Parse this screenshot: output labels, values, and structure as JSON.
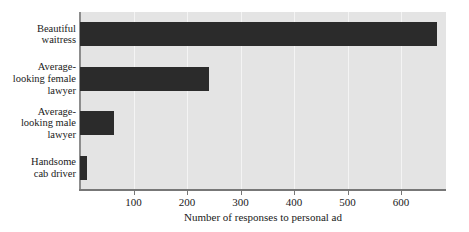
{
  "chart_data": {
    "type": "bar",
    "orientation": "horizontal",
    "title": "",
    "xlabel": "Number of responses to personal ad",
    "ylabel": "",
    "categories": [
      "Beautiful waitress",
      "Average-looking female lawyer",
      "Average-looking male lawyer",
      "Handsome cab driver"
    ],
    "category_lines": [
      [
        "Beautiful",
        "waitress"
      ],
      [
        "Average-",
        "looking female",
        "lawyer"
      ],
      [
        "Average-",
        "looking male",
        "lawyer"
      ],
      [
        "Handsome",
        "cab driver"
      ]
    ],
    "values": [
      668,
      241,
      64,
      13
    ],
    "xlim": [
      0,
      684
    ],
    "xticks": [
      100,
      200,
      300,
      400,
      500,
      600
    ],
    "xtick_labels": [
      "100",
      "200",
      "300",
      "400",
      "500",
      "600"
    ],
    "grid": "vertical",
    "legend": null,
    "colors": {
      "bar": "#2b2b2b",
      "plot_background": "#e4e4e4",
      "page_background": "#ffffff",
      "gridline": "#f4f4f4",
      "axis": "#777777",
      "text": "#1a1a1a"
    }
  }
}
